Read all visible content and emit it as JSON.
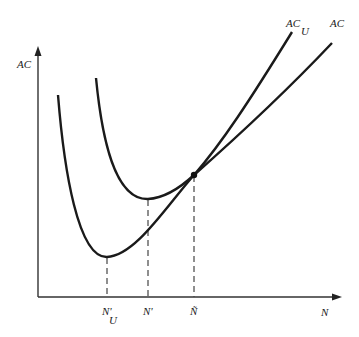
{
  "diagram": {
    "type": "economics-cost-curves",
    "axes": {
      "y_label": "AC",
      "x_label": "N"
    },
    "curves": [
      {
        "name": "AC_U",
        "label_main": "AC",
        "label_sub": "U"
      },
      {
        "name": "AC",
        "label_main": "AC"
      }
    ],
    "markers": [
      {
        "label_main": "N'",
        "label_sub": "U",
        "description": "minimum of AC_U"
      },
      {
        "label_main": "N'",
        "description": "minimum of AC"
      },
      {
        "label_main": "Ñ",
        "description": "intersection of AC and AC_U"
      }
    ],
    "colors": {
      "line": "#1a1a1a",
      "axis": "#333333",
      "background": "#ffffff"
    }
  }
}
